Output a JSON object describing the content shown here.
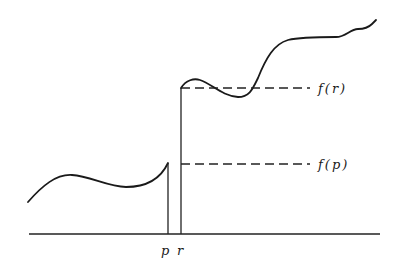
{
  "diagram": {
    "labels": {
      "f_r": "f(r)",
      "f_p": "f(p)",
      "p": "p",
      "r": "r"
    },
    "axis": {
      "x1": 29,
      "x2": 380,
      "y": 234
    },
    "points": {
      "p": {
        "x": 168,
        "f_y": 163
      },
      "r": {
        "x": 181,
        "f_y": 88
      }
    },
    "dashed_lines": [
      {
        "name": "f(r)",
        "y": 88,
        "x1": 181,
        "x2": 310
      },
      {
        "name": "f(p)",
        "y": 164,
        "x1": 181,
        "x2": 310
      }
    ],
    "colors": {
      "stroke": "#1a1a1a",
      "background": "#ffffff"
    }
  }
}
